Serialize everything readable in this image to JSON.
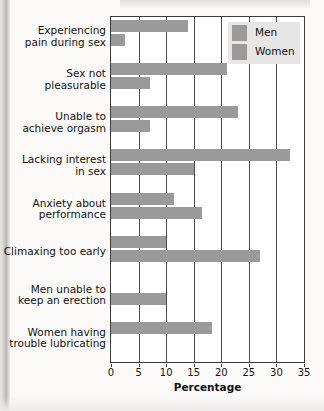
{
  "chart_data": {
    "type": "bar",
    "orientation": "horizontal",
    "title": "",
    "xlabel": "Percentage",
    "ylabel": "",
    "xlim": [
      0,
      35
    ],
    "xticks": [
      0,
      5,
      10,
      15,
      20,
      25,
      30,
      35
    ],
    "grid": true,
    "legend_position": "top-right",
    "categories": [
      "Experiencing pain during sex",
      "Sex not pleasurable",
      "Unable to achieve orgasm",
      "Lacking interest in sex",
      "Anxiety about performance",
      "Climaxing too early",
      "Men unable to keep an erection",
      "Women having trouble lubricating"
    ],
    "series": [
      {
        "name": "Women",
        "values": [
          14,
          21,
          23,
          32.5,
          11.5,
          10,
          null,
          18.3
        ]
      },
      {
        "name": "Men",
        "values": [
          2.5,
          7,
          7,
          15,
          16.5,
          27,
          10,
          null
        ]
      }
    ],
    "bar_color": "#9a9a9a",
    "plot_background": "#ffffff",
    "axis_color": "#3d3d3d"
  },
  "category_labels": [
    {
      "line1": "Experiencing",
      "line2": "pain during sex"
    },
    {
      "line1": "Sex not",
      "line2": "pleasurable"
    },
    {
      "line1": "Unable to",
      "line2": "achieve orgasm"
    },
    {
      "line1": "Lacking interest",
      "line2": "in sex"
    },
    {
      "line1": "Anxiety about",
      "line2": "performance"
    },
    {
      "line1": "Climaxing too early",
      "line2": ""
    },
    {
      "line1": "Men unable to",
      "line2": "keep an erection"
    },
    {
      "line1": "Women having",
      "line2": "trouble lubricating"
    }
  ],
  "axis": {
    "tick_labels": [
      "0",
      "5",
      "10",
      "15",
      "20",
      "25",
      "30",
      "35"
    ],
    "title": "Percentage"
  },
  "legend": {
    "items": [
      {
        "label": "Men",
        "color": "#9a9a9a"
      },
      {
        "label": "Women",
        "color": "#9a9a9a"
      }
    ]
  }
}
